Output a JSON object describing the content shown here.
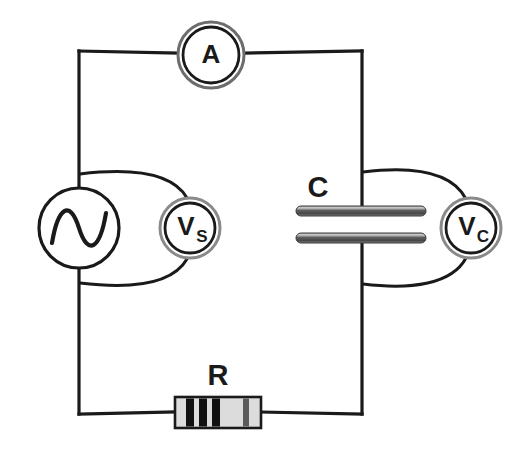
{
  "diagram": {
    "type": "circuit-schematic",
    "background_color": "#ffffff",
    "wire_color": "#1a1a1a",
    "wire_width": 3.2
  },
  "labels": {
    "ammeter": "A",
    "source_voltmeter": "V",
    "source_voltmeter_subscript": "S",
    "capacitor_voltmeter": "V",
    "capacitor_voltmeter_subscript": "C",
    "capacitor": "C",
    "resistor": "R"
  },
  "components": {
    "ammeter": {
      "name": "ammeter",
      "label": "A",
      "shape": "double-ring-circle",
      "cx": 211,
      "cy": 55,
      "r_outer": 33,
      "r_inner": 28,
      "stroke": "#3d3d3d",
      "inner_stroke": "#1a1a1a"
    },
    "ac_source": {
      "name": "ac-voltage-source",
      "symbol": "sine-wave-in-circle",
      "cx": 79,
      "cy": 228,
      "r": 40,
      "stroke": "#1a1a1a"
    },
    "source_voltmeter": {
      "name": "voltmeter-source",
      "label": "VS",
      "shape": "double-ring-circle",
      "cx": 190,
      "cy": 228,
      "r_outer": 30,
      "r_inner": 25,
      "stroke": "#8a8a8a",
      "inner_stroke": "#1a1a1a"
    },
    "capacitor": {
      "name": "capacitor",
      "label": "C",
      "plate_left_x": 296,
      "plate_right_x": 426,
      "top_plate_y": 211,
      "bottom_plate_y": 238,
      "plate_thickness": 9,
      "plate_fill_light": "#b9b9b9",
      "plate_fill_dark": "#4a4a4a"
    },
    "capacitor_voltmeter": {
      "name": "voltmeter-capacitor",
      "label": "VC",
      "shape": "double-ring-circle",
      "cx": 471,
      "cy": 228,
      "r_outer": 30,
      "r_inner": 25,
      "stroke": "#8a8a8a",
      "inner_stroke": "#1a1a1a"
    },
    "resistor": {
      "name": "resistor",
      "label": "R",
      "body_x": 175,
      "body_y": 397,
      "body_w": 86,
      "body_h": 31,
      "body_fill": "#dcdcdc",
      "body_stroke": "#1a1a1a",
      "band_color": "#111111",
      "bands": [
        {
          "x": 186,
          "w": 8
        },
        {
          "x": 199,
          "w": 8
        },
        {
          "x": 212,
          "w": 8
        },
        {
          "x": 243,
          "w": 7
        }
      ]
    }
  },
  "wires": {
    "frame_left_x": 79,
    "frame_right_x": 362,
    "frame_top_y": 51,
    "frame_bottom_y": 414,
    "description": "Rectangular loop: AC source on left branch, ammeter on top, resistor on bottom, capacitor on right branch"
  },
  "colors": {
    "ink": "#1a1a1a",
    "meter_ring": "#8a8a8a",
    "plate_metal": "#6e6e6e",
    "resistor_body": "#dcdcdc"
  }
}
